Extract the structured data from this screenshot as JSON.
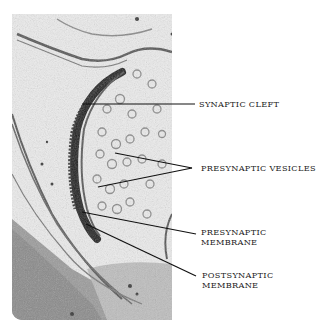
{
  "figure": {
    "labels": [
      {
        "id": "synaptic-cleft",
        "text": "SYNAPTIC CLEFT"
      },
      {
        "id": "presynaptic-vesicles",
        "text": "PRESYNAPTIC VESICLES"
      },
      {
        "id": "presynaptic-membrane",
        "line1": "PRESYNAPTIC",
        "line2": "MEMBRANE"
      },
      {
        "id": "postsynaptic-membrane",
        "line1": "POSTSYNAPTIC",
        "line2": "MEMBRANE"
      }
    ],
    "colors": {
      "background": "#ffffff",
      "text": "#222222",
      "leader": "#111111"
    }
  }
}
